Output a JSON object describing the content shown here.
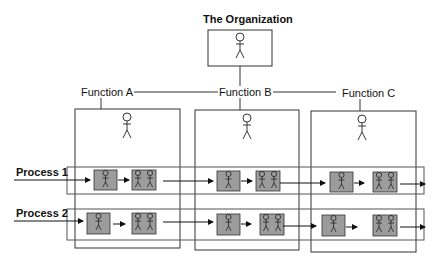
{
  "diagram": {
    "title": "The Organization",
    "functions": [
      {
        "label": "Function A"
      },
      {
        "label": "Function B"
      },
      {
        "label": "Function C"
      }
    ],
    "processes": [
      {
        "label": "Process 1"
      },
      {
        "label": "Process 2"
      }
    ],
    "colors": {
      "line": "#333333",
      "box_fill": "#9c9c9c",
      "row_border": "#555555"
    }
  }
}
